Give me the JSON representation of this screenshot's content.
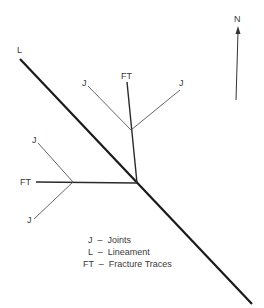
{
  "diagram": {
    "title": "",
    "labels": {
      "lineament": "L",
      "north": "N",
      "ft_top": "FT",
      "j_top_left": "J",
      "j_top_right": "J",
      "ft_left": "FT",
      "j_left_upper": "J",
      "j_left_lower": "J"
    },
    "legend": [
      {
        "row": "  J  –  Joints"
      },
      {
        "row": "  L  –  Lineament"
      },
      {
        "row": "FT  –  Fracture Traces"
      }
    ],
    "colors": {
      "lineament": "#1a1a1a",
      "fracture_trace": "#2a2a2a",
      "joint": "#555555",
      "text": "#3a3a3a"
    }
  }
}
